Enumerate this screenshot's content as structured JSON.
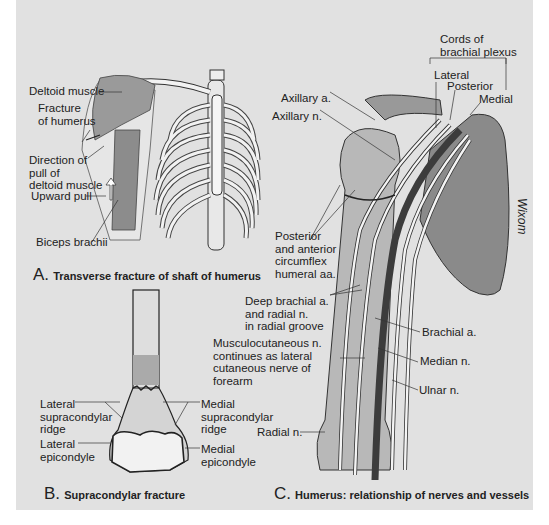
{
  "panel_a": {
    "caption_letter": "A.",
    "caption_text": "Transverse fracture of shaft of humerus",
    "labels": {
      "deltoid": "Deltoid muscle",
      "fracture": "Fracture\nof humerus",
      "direction": "Direction of\npull of\ndeltoid muscle",
      "upward": "Upward pull",
      "biceps": "Biceps brachii"
    }
  },
  "panel_b": {
    "caption_letter": "B.",
    "caption_text": "Supracondylar fracture",
    "labels": {
      "lat_ridge": "Lateral\nsupracondylar\nridge",
      "lat_epi": "Lateral\nepicondyle",
      "med_ridge": "Medial\nsupracondylar\nridge",
      "med_epi": "Medial\nepicondyle"
    }
  },
  "panel_c": {
    "caption_letter": "C.",
    "caption_text": "Humerus: relationship of nerves and vessels",
    "labels": {
      "cords": "Cords of\nbrachial plexus",
      "lateral": "Lateral",
      "posterior": "Posterior",
      "medial": "Medial",
      "axillary_a": "Axillary a.",
      "axillary_n": "Axillary n.",
      "circumflex": "Posterior\nand anterior\ncircumflex\nhumeral aa.",
      "deep_brachial": "Deep brachial a.\nand radial n.\nin radial groove",
      "musculocutaneous": "Musculocutaneous n.\ncontinues as lateral\ncutaneous nerve of\nforearm",
      "brachial_a": "Brachial a.",
      "median_n": "Median n.",
      "ulnar_n": "Ulnar n.",
      "radial_n": "Radial n.",
      "signature": "Wixom"
    }
  },
  "colors": {
    "background": "#e1e1e1",
    "bone": "#c8c8c8",
    "artery": "#4a4a4a",
    "nerve": "#f4f4f4",
    "outline": "#222222"
  }
}
